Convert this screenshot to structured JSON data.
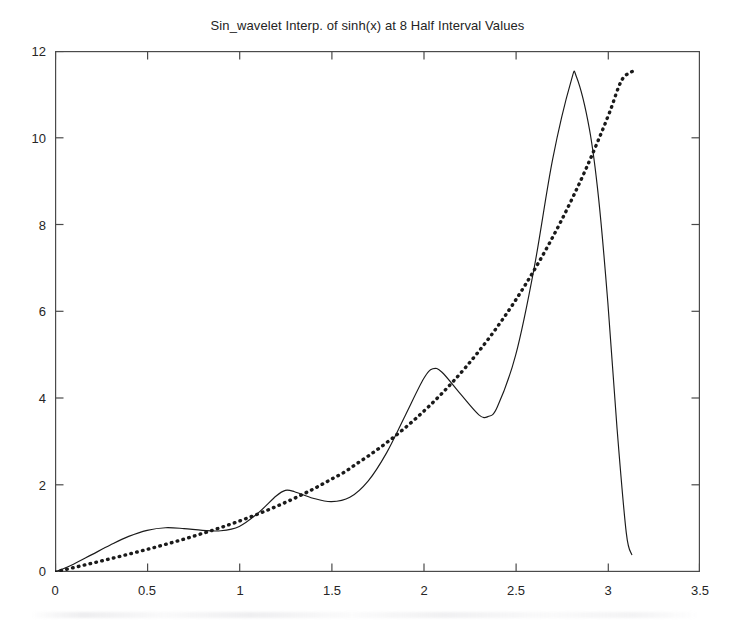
{
  "figure": {
    "width": 735,
    "height": 628,
    "background_color": "#ffffff",
    "foreground_color": "#1a1a1a"
  },
  "chart_data": {
    "type": "line",
    "title": "Sin_wavelet Interp. of sinh(x) at 8 Half Interval Values",
    "xlabel": "",
    "ylabel": "",
    "xlim": [
      0,
      3.5
    ],
    "ylim": [
      0,
      12
    ],
    "xticks": [
      0,
      0.5,
      1,
      1.5,
      2,
      2.5,
      3,
      3.5
    ],
    "xtick_labels": [
      "0",
      "0.5",
      "1",
      "1.5",
      "2",
      "2.5",
      "3",
      "3.5"
    ],
    "yticks": [
      0,
      2,
      4,
      6,
      8,
      10,
      12
    ],
    "ytick_labels": [
      "0",
      "2",
      "4",
      "6",
      "8",
      "10",
      "12"
    ],
    "grid": false,
    "legend": null,
    "legend_position": "none",
    "box": true,
    "tick_direction": "in",
    "series": [
      {
        "name": "sinh(x)",
        "style": "dotted",
        "linewidth": 3.2,
        "color": "#1a1a1a",
        "marker": "dot",
        "x": [
          0.0,
          0.0654,
          0.1309,
          0.1963,
          0.2618,
          0.3272,
          0.3927,
          0.4581,
          0.5236,
          0.589,
          0.6545,
          0.7199,
          0.7854,
          0.8508,
          0.9163,
          0.9817,
          1.0472,
          1.1126,
          1.1781,
          1.2435,
          1.309,
          1.3744,
          1.4399,
          1.5053,
          1.5708,
          1.6362,
          1.7017,
          1.7671,
          1.8326,
          1.898,
          1.9635,
          2.0289,
          2.0944,
          2.1598,
          2.2253,
          2.2907,
          2.3562,
          2.4216,
          2.4871,
          2.5525,
          2.618,
          2.6834,
          2.7489,
          2.8143,
          2.8798,
          2.9452,
          3.0107,
          3.0761,
          3.1416
        ],
        "y": [
          0.0,
          0.0654,
          0.1313,
          0.1976,
          0.2648,
          0.3331,
          0.4029,
          0.4742,
          0.5475,
          0.6231,
          0.7013,
          0.7823,
          0.8687,
          0.9552,
          1.0477,
          1.1448,
          1.247,
          1.3548,
          1.4687,
          1.5892,
          1.7171,
          1.8528,
          1.9972,
          2.151,
          2.3013,
          2.4911,
          2.6771,
          2.8757,
          3.0879,
          3.3145,
          3.5564,
          3.8147,
          4.0904,
          4.3848,
          4.699,
          5.0344,
          5.3922,
          5.7742,
          6.1819,
          6.617,
          7.0813,
          7.5768,
          8.1057,
          8.6701,
          9.2726,
          9.9155,
          10.6018,
          11.3342,
          11.5487
        ],
        "note": "thick dotted curve, the target function sinh(x) on [0, pi]"
      },
      {
        "name": "sin_wavelet interpolant",
        "style": "solid",
        "linewidth": 1.0,
        "color": "#1a1a1a",
        "marker": "none",
        "x": [
          0.0,
          0.1,
          0.2,
          0.3,
          0.4,
          0.5,
          0.6,
          0.7,
          0.8,
          0.9,
          1.0,
          1.1,
          1.2,
          1.25,
          1.3,
          1.4,
          1.5,
          1.6,
          1.7,
          1.8,
          1.9,
          2.0,
          2.05,
          2.1,
          2.2,
          2.3,
          2.35,
          2.4,
          2.5,
          2.6,
          2.7,
          2.8,
          2.83,
          2.9,
          2.95,
          3.0,
          3.05,
          3.1,
          3.13
        ],
        "y": [
          0.0,
          0.18,
          0.4,
          0.62,
          0.82,
          0.96,
          1.02,
          1.0,
          0.96,
          0.95,
          1.05,
          1.35,
          1.75,
          1.88,
          1.85,
          1.7,
          1.62,
          1.72,
          2.1,
          2.75,
          3.6,
          4.45,
          4.68,
          4.6,
          4.1,
          3.62,
          3.58,
          3.8,
          5.0,
          7.0,
          9.5,
          11.3,
          11.4,
          10.2,
          8.6,
          6.2,
          3.3,
          0.9,
          0.4
        ],
        "note": "thin solid oscillating curve, the sine-wavelet interpolant, equals sinh at the 8 half-interval nodes then diverges and plunges near x = pi"
      }
    ],
    "interpolation_nodes": {
      "count": 8,
      "description": "8 Half Interval Values",
      "x": [
        0.0,
        0.3927,
        0.7854,
        1.1781,
        1.5708,
        1.9635,
        2.3562,
        2.7489
      ],
      "y": [
        0.0,
        0.4029,
        0.8687,
        1.4687,
        2.3013,
        3.5564,
        5.3922,
        8.1057
      ]
    }
  }
}
